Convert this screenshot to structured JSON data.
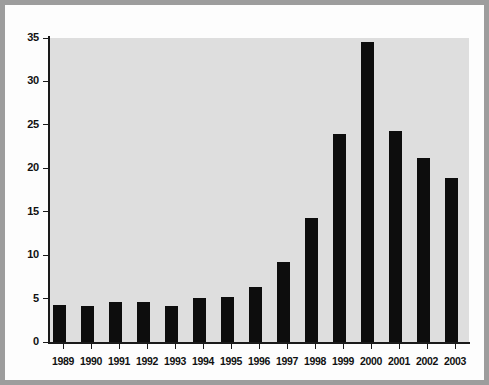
{
  "figure": {
    "frame_color": "#9d9d9d",
    "page_color": "#fdfdfd",
    "panel_color": "#dedede",
    "bar_color": "#0d0d0d",
    "axis_color": "#1a1a1a"
  },
  "chart_data": {
    "type": "bar",
    "title": "",
    "xlabel": "",
    "ylabel": "",
    "ylim": [
      0,
      35
    ],
    "yticks": [
      0,
      5,
      10,
      15,
      20,
      25,
      30,
      35
    ],
    "ytick_labels": [
      "0",
      "5",
      "10",
      "15",
      "20",
      "25",
      "30",
      "35"
    ],
    "grid": false,
    "legend": null,
    "categories": [
      "1989",
      "1990",
      "1991",
      "1992",
      "1993",
      "1994",
      "1995",
      "1996",
      "1997",
      "1998",
      "1999",
      "2000",
      "2001",
      "2002",
      "2003"
    ],
    "values": [
      4.3,
      4.2,
      4.6,
      4.6,
      4.2,
      5.1,
      5.2,
      6.3,
      9.2,
      14.3,
      24.0,
      34.5,
      24.3,
      21.2,
      18.9
    ]
  }
}
